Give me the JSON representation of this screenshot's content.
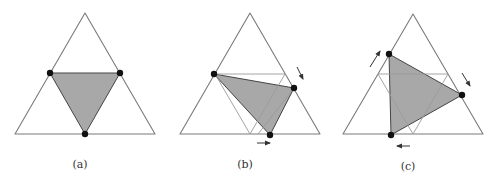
{
  "figure": {
    "colors": {
      "outline": "#7a7a7a",
      "thin_line": "#9a9a9a",
      "fill": "#a8a8a8",
      "fill_stroke": "#444444",
      "vertex": "#111111",
      "arrow": "#333333"
    },
    "panels": [
      {
        "id": "a",
        "label": "(a)",
        "label_pos": [
          80,
          158
        ],
        "outer": [
          [
            85,
            13
          ],
          [
            15,
            134
          ],
          [
            155,
            134
          ]
        ],
        "thin_lines": [],
        "shaded": [
          [
            50,
            73
          ],
          [
            120,
            73
          ],
          [
            85,
            134
          ]
        ],
        "vertices": [
          [
            50,
            73
          ],
          [
            120,
            73
          ],
          [
            85,
            134
          ]
        ],
        "arrows": []
      },
      {
        "id": "b",
        "label": "(b)",
        "label_pos": [
          245,
          158
        ],
        "outer": [
          [
            250,
            13
          ],
          [
            180,
            134
          ],
          [
            320,
            134
          ]
        ],
        "thin_lines": [
          [
            [
              215,
              74
            ],
            [
              285,
              74
            ]
          ],
          [
            [
              215,
              74
            ],
            [
              250,
              134
            ]
          ],
          [
            [
              285,
              74
            ],
            [
              250,
              134
            ]
          ],
          [
            [
              294,
              88
            ],
            [
              258,
              134
            ]
          ]
        ],
        "shaded": [
          [
            214,
            74
          ],
          [
            294,
            88
          ],
          [
            270,
            135
          ]
        ],
        "vertices": [
          [
            214,
            74
          ],
          [
            294,
            88
          ],
          [
            270,
            135
          ]
        ],
        "arrows": [
          {
            "from": [
              297,
              67
            ],
            "to": [
              303,
              79
            ]
          },
          {
            "from": [
              257,
              143
            ],
            "to": [
              270,
              143
            ]
          }
        ]
      },
      {
        "id": "c",
        "label": "(c)",
        "label_pos": [
          408,
          160
        ],
        "outer": [
          [
            413,
            14
          ],
          [
            343,
            134
          ],
          [
            483,
            134
          ]
        ],
        "thin_lines": [
          [
            [
              378,
              74
            ],
            [
              448,
              74
            ]
          ],
          [
            [
              378,
              74
            ],
            [
              413,
              134
            ]
          ],
          [
            [
              448,
              74
            ],
            [
              413,
              134
            ]
          ]
        ],
        "shaded": [
          [
            389,
            54
          ],
          [
            462,
            95
          ],
          [
            391,
            135
          ]
        ],
        "vertices": [
          [
            389,
            54
          ],
          [
            462,
            95
          ],
          [
            391,
            135
          ]
        ],
        "arrows": [
          {
            "from": [
              370,
              67
            ],
            "to": [
              380,
              51
            ]
          },
          {
            "from": [
              462,
              73
            ],
            "to": [
              470,
              86
            ]
          },
          {
            "from": [
              410,
              146
            ],
            "to": [
              397,
              146
            ]
          }
        ]
      }
    ]
  }
}
